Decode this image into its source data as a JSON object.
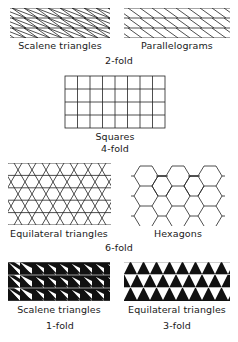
{
  "figure": {
    "groups": [
      {
        "fold_label": "2-fold",
        "tilings": [
          {
            "name": "Scalene triangles",
            "style": "hatched"
          },
          {
            "name": "Parallelograms",
            "style": "outline"
          }
        ]
      },
      {
        "fold_label": "4-fold",
        "tilings": [
          {
            "name": "Squares",
            "style": "outline"
          }
        ]
      },
      {
        "fold_label": "6-fold",
        "tilings": [
          {
            "name": "Equilateral triangles",
            "style": "outline"
          },
          {
            "name": "Hexagons",
            "style": "outline"
          }
        ]
      },
      {
        "fold_label": null,
        "tilings": [
          {
            "name": "Scalene triangles",
            "style": "filled",
            "fold_label": "1-fold"
          },
          {
            "name": "Equilateral triangles",
            "style": "filled",
            "fold_label": "3-fold"
          }
        ]
      }
    ]
  }
}
